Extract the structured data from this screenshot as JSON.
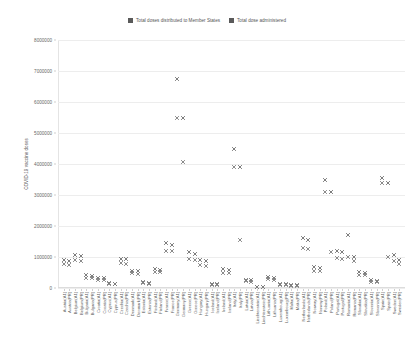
{
  "legend": {
    "position": "top-center",
    "items": [
      {
        "label": "Total doses distributed to Member States",
        "color": "#5a5a5a",
        "marker": "x"
      },
      {
        "label": "Total dose administered",
        "color": "#5a5a5a",
        "marker": "x"
      }
    ]
  },
  "axes": {
    "ylabel": "COVID-19 vaccine doses",
    "xlabel": "",
    "yticks": [
      "0",
      "1000000",
      "2000000",
      "3000000",
      "4000000",
      "5000000",
      "6000000",
      "7000000",
      "8000000"
    ]
  },
  "chart_data": {
    "type": "scatter",
    "title": "",
    "subtitle": "",
    "xlabel": "",
    "ylabel": "COVID-19 vaccine doses",
    "ylim": [
      0,
      8000000
    ],
    "ytick_step": 1000000,
    "grid": "horizontal",
    "legend_position": "top-center",
    "marker": "x",
    "categories": [
      "Austria(A1)",
      "Austria(PR)",
      "Belgium(A1)",
      "Belgium(PR)",
      "Bulgaria(A1)",
      "Bulgaria(PR)",
      "Croatia(A1)",
      "Croatia(PR)",
      "Cyprus(A1)",
      "Cyprus(PR)",
      "Czechia(A1)",
      "Czechia(PR)",
      "Denmark(A1)",
      "Denmark(PR)",
      "Estonia(A1)",
      "Estonia(PR)",
      "Finland(A1)",
      "Finland(PR)",
      "France(A1)",
      "France(PR)",
      "Germany(A1)",
      "Germany(PR)",
      "Greece(A1)",
      "Greece(PR)",
      "Hungary(A1)",
      "Hungary(PR)",
      "Iceland(A1)",
      "Iceland(PR)",
      "Ireland(A1)",
      "Ireland(PR)",
      "Italy(A1)",
      "Italy(PR)",
      "Latvia(A1)",
      "Latvia(PR)",
      "Liechtenstein(A1)",
      "Liechtenstein(PR)",
      "Lithuania(A1)",
      "Lithuania(PR)",
      "Luxembourg(A1)",
      "Luxembourg(PR)",
      "Malta(A1)",
      "Malta(PR)",
      "Netherlands(A1)",
      "Netherlands(PR)",
      "Norway(A1)",
      "Norway(PR)",
      "Poland(A1)",
      "Poland(PR)",
      "Portugal(A1)",
      "Portugal(PR)",
      "Romania(A1)",
      "Romania(PR)",
      "Slovakia(A1)",
      "Slovakia(PR)",
      "Slovenia(A1)",
      "Slovenia(PR)",
      "Spain(A1)",
      "Spain(PR)",
      "Sweden(A1)",
      "Sweden(PR)"
    ],
    "series": [
      {
        "name": "Total doses distributed to Member States",
        "color": "#6d6d6d",
        "values": [
          900000,
          870000,
          1050000,
          1020000,
          420000,
          400000,
          330000,
          320000,
          150000,
          145000,
          950000,
          930000,
          560000,
          550000,
          180000,
          175000,
          600000,
          590000,
          1450000,
          1400000,
          6750000,
          5500000,
          1150000,
          1100000,
          900000,
          880000,
          120000,
          115000,
          600000,
          590000,
          4500000,
          3900000,
          260000,
          250000,
          40000,
          38000,
          340000,
          330000,
          120000,
          115000,
          90000,
          88000,
          1600000,
          1550000,
          680000,
          660000,
          3500000,
          3100000,
          1200000,
          1150000,
          1700000,
          1000000,
          520000,
          500000,
          250000,
          240000,
          3550000,
          3400000,
          1050000,
          900000
        ]
      },
      {
        "name": "Total dose administered",
        "color": "#7d7d7d",
        "values": [
          760000,
          740000,
          890000,
          870000,
          330000,
          320000,
          270000,
          260000,
          120000,
          118000,
          800000,
          780000,
          470000,
          460000,
          150000,
          145000,
          520000,
          510000,
          1200000,
          1180000,
          5500000,
          4050000,
          930000,
          900000,
          740000,
          720000,
          95000,
          92000,
          500000,
          490000,
          3900000,
          1550000,
          210000,
          205000,
          30000,
          28000,
          280000,
          270000,
          95000,
          92000,
          72000,
          70000,
          1300000,
          1250000,
          560000,
          550000,
          3100000,
          1150000,
          980000,
          950000,
          1000000,
          880000,
          430000,
          420000,
          200000,
          195000,
          3400000,
          1000000,
          880000,
          760000
        ]
      }
    ]
  }
}
